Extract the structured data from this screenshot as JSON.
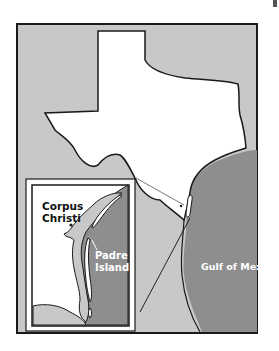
{
  "map": {
    "labels": {
      "city": [
        "Corpus",
        "Christi"
      ],
      "island": [
        "Padre",
        "Island"
      ],
      "gulf": "Gulf of Mexico"
    },
    "colors": {
      "land_texas": "#ffffff",
      "land_other": "#c8c8c8",
      "gulf": "#8e8e8e",
      "outline": "#1a1a1a",
      "label_dark": "#111111",
      "label_light": "#ffffff"
    }
  }
}
